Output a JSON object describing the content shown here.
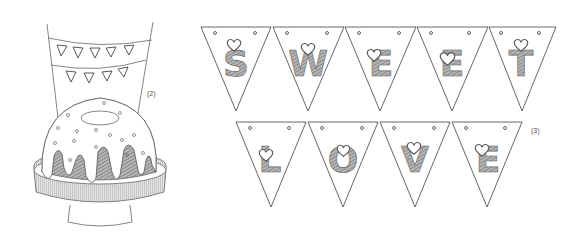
{
  "illustration": {
    "style": "pencil-sketch",
    "cake_scene": {
      "label": "(2)",
      "garland_rows": [
        {
          "letters": [
            "S",
            "W",
            "E",
            "E",
            "T"
          ]
        },
        {
          "letters": [
            "L",
            "O",
            "V",
            "E"
          ]
        }
      ]
    },
    "bunting": {
      "label": "(3)",
      "rows": [
        {
          "name": "top",
          "letters": [
            "S",
            "W",
            "E",
            "E",
            "T"
          ]
        },
        {
          "name": "bottom",
          "letters": [
            "L",
            "O",
            "V",
            "E"
          ]
        }
      ]
    }
  },
  "colors": {
    "line": "#555555",
    "shade": "#8a8a8a",
    "background": "#ffffff"
  }
}
